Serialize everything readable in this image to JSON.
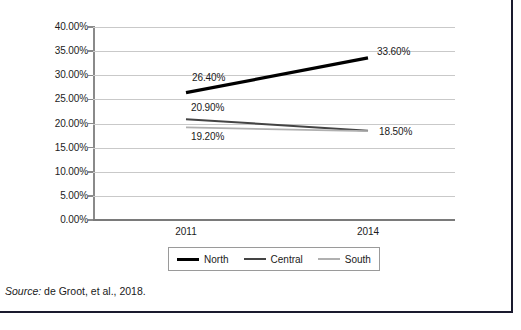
{
  "figure": {
    "source_prefix": "Source:",
    "source_text": " de Groot, et al., 2018."
  },
  "chart_data": {
    "type": "line",
    "title": "",
    "xlabel": "",
    "ylabel": "",
    "categories": [
      "2011",
      "2014"
    ],
    "x": [
      2011,
      2014
    ],
    "ylim": [
      0,
      40
    ],
    "ytick_labels": [
      "0.00%",
      "5.00%",
      "10.00%",
      "15.00%",
      "20.00%",
      "25.00%",
      "30.00%",
      "35.00%",
      "40.00%"
    ],
    "ytick_values": [
      0,
      5,
      10,
      15,
      20,
      25,
      30,
      35,
      40
    ],
    "grid": true,
    "legend_position": "bottom",
    "series": [
      {
        "name": "North",
        "values": [
          26.4,
          33.6
        ],
        "color": "#000000",
        "labels": [
          "26.40%",
          "33.60%"
        ]
      },
      {
        "name": "Central",
        "values": [
          20.9,
          18.5
        ],
        "color": "#444444",
        "labels": [
          "20.90%",
          "18.50%"
        ]
      },
      {
        "name": "South",
        "values": [
          19.2,
          18.4
        ],
        "color": "#b0b0b0",
        "labels": [
          "19.20%",
          ""
        ]
      }
    ],
    "annotations": [
      {
        "text": "26.40%",
        "series": "North",
        "point": 0
      },
      {
        "text": "33.60%",
        "series": "North",
        "point": 1
      },
      {
        "text": "20.90%",
        "series": "Central",
        "point": 0
      },
      {
        "text": "18.50%",
        "series": "Central",
        "point": 1
      },
      {
        "text": "19.20%",
        "series": "South",
        "point": 0
      }
    ]
  },
  "legend": {
    "items": [
      {
        "label": "North"
      },
      {
        "label": "Central"
      },
      {
        "label": "South"
      }
    ]
  },
  "colors": {
    "north": "#000000",
    "central": "#444444",
    "south": "#b0b0b0",
    "gridline": "#c9c9c9",
    "axis": "#8a8a8a",
    "frame": "#1a1a2e"
  }
}
